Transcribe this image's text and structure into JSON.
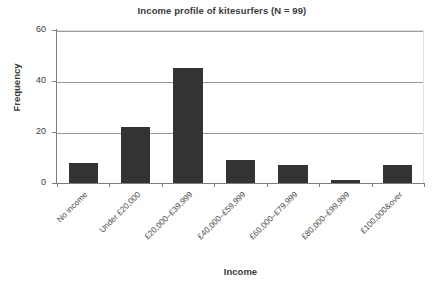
{
  "chart_data": {
    "type": "bar",
    "title": "Income profile of kitesurfers (N = 99)",
    "xlabel": "Income",
    "ylabel": "Frequency",
    "categories": [
      "No income",
      "Under £20,000",
      "£20,000–£39,999",
      "£40,000–£59,999",
      "£60,000–£79,999",
      "£80,000–£99,999",
      "£100,000&over"
    ],
    "values": [
      8,
      22,
      45,
      9,
      7,
      1,
      7
    ],
    "ylim": [
      0,
      60
    ],
    "yticks": [
      0,
      20,
      40,
      60
    ],
    "ytick_labels": [
      "0",
      "20",
      "40",
      "60"
    ],
    "grid": true,
    "legend": false,
    "bar_color": "#333333",
    "axis_color": "#7d7d7d",
    "grid_color": "#9d9d9d",
    "background": "#ffffff"
  }
}
